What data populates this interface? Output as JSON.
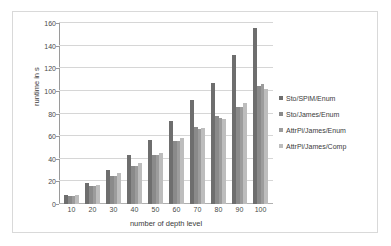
{
  "chart_data": {
    "type": "bar",
    "title": "",
    "xlabel": "number of depth level",
    "ylabel": "runtime in s",
    "categories": [
      "10",
      "20",
      "30",
      "40",
      "50",
      "60",
      "70",
      "80",
      "90",
      "100"
    ],
    "ylim": [
      0,
      160
    ],
    "yticks": [
      0,
      20,
      40,
      60,
      80,
      100,
      120,
      140,
      160
    ],
    "grid": true,
    "legend_position": "right",
    "series": [
      {
        "name": "Sto/SPiM/Enum",
        "color": "#6e6e6e",
        "values": [
          8,
          19,
          30,
          43,
          57,
          73,
          92,
          107,
          132,
          156
        ]
      },
      {
        "name": "Sto/James/Enum",
        "color": "#8a8a8a",
        "values": [
          7,
          16,
          25,
          34,
          43,
          56,
          68,
          78,
          86,
          104
        ]
      },
      {
        "name": "AttrPi/James/Enum",
        "color": "#9c9c9c",
        "values": [
          7,
          16,
          25,
          34,
          43,
          56,
          66,
          76,
          86,
          106
        ]
      },
      {
        "name": "AttrPi/James/Comp",
        "color": "#bdbdbd",
        "values": [
          8,
          17,
          27,
          36,
          45,
          58,
          67,
          75,
          89,
          102
        ]
      }
    ]
  }
}
